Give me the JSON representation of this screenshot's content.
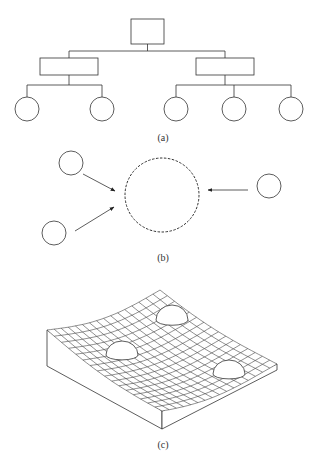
{
  "figure": {
    "panels": [
      {
        "id": "a",
        "label": "(a)",
        "description": "hierarchical tree: root box, two intermediate boxes, five leaf circles"
      },
      {
        "id": "b",
        "label": "(b)",
        "description": "three small circles with arrows converging on a large dashed circle"
      },
      {
        "id": "c",
        "label": "(c)",
        "description": "3D curved grid surface with three hemispherical bumps"
      }
    ],
    "colors": {
      "stroke": "#333333",
      "background": "#ffffff"
    }
  },
  "tree": {
    "root": {
      "x": 131,
      "y": 19,
      "w": 33,
      "h": 25
    },
    "mids": [
      {
        "x": 40,
        "y": 58,
        "w": 58,
        "h": 17,
        "children_x": [
          27,
          102
        ]
      },
      {
        "x": 196,
        "y": 58,
        "w": 58,
        "h": 17,
        "children_x": [
          176,
          234,
          291
        ]
      }
    ],
    "leaf_y": 109,
    "leaf_r": 12
  },
  "convergence": {
    "target": {
      "cx": 162,
      "cy": 195,
      "r": 37
    },
    "sources": [
      {
        "cx": 71,
        "cy": 163,
        "r": 12,
        "arrow": [
          83,
          174,
          115,
          191
        ]
      },
      {
        "cx": 54,
        "cy": 233,
        "r": 12,
        "arrow": [
          75,
          231,
          114,
          207
        ]
      },
      {
        "cx": 269,
        "cy": 186,
        "r": 12,
        "arrow": [
          248,
          190,
          208,
          190
        ]
      }
    ]
  },
  "surface": {
    "corners": {
      "left": [
        47,
        336
      ],
      "back": [
        160,
        290
      ],
      "right": [
        277,
        364
      ],
      "front": [
        162,
        411
      ]
    },
    "depth": 18,
    "grid": 16,
    "bumps": [
      {
        "cx": 122,
        "cy": 355,
        "rx": 16,
        "ry": 14
      },
      {
        "cx": 172,
        "cy": 320,
        "rx": 16,
        "ry": 15
      },
      {
        "cx": 229,
        "cy": 374,
        "rx": 16,
        "ry": 14
      }
    ]
  }
}
